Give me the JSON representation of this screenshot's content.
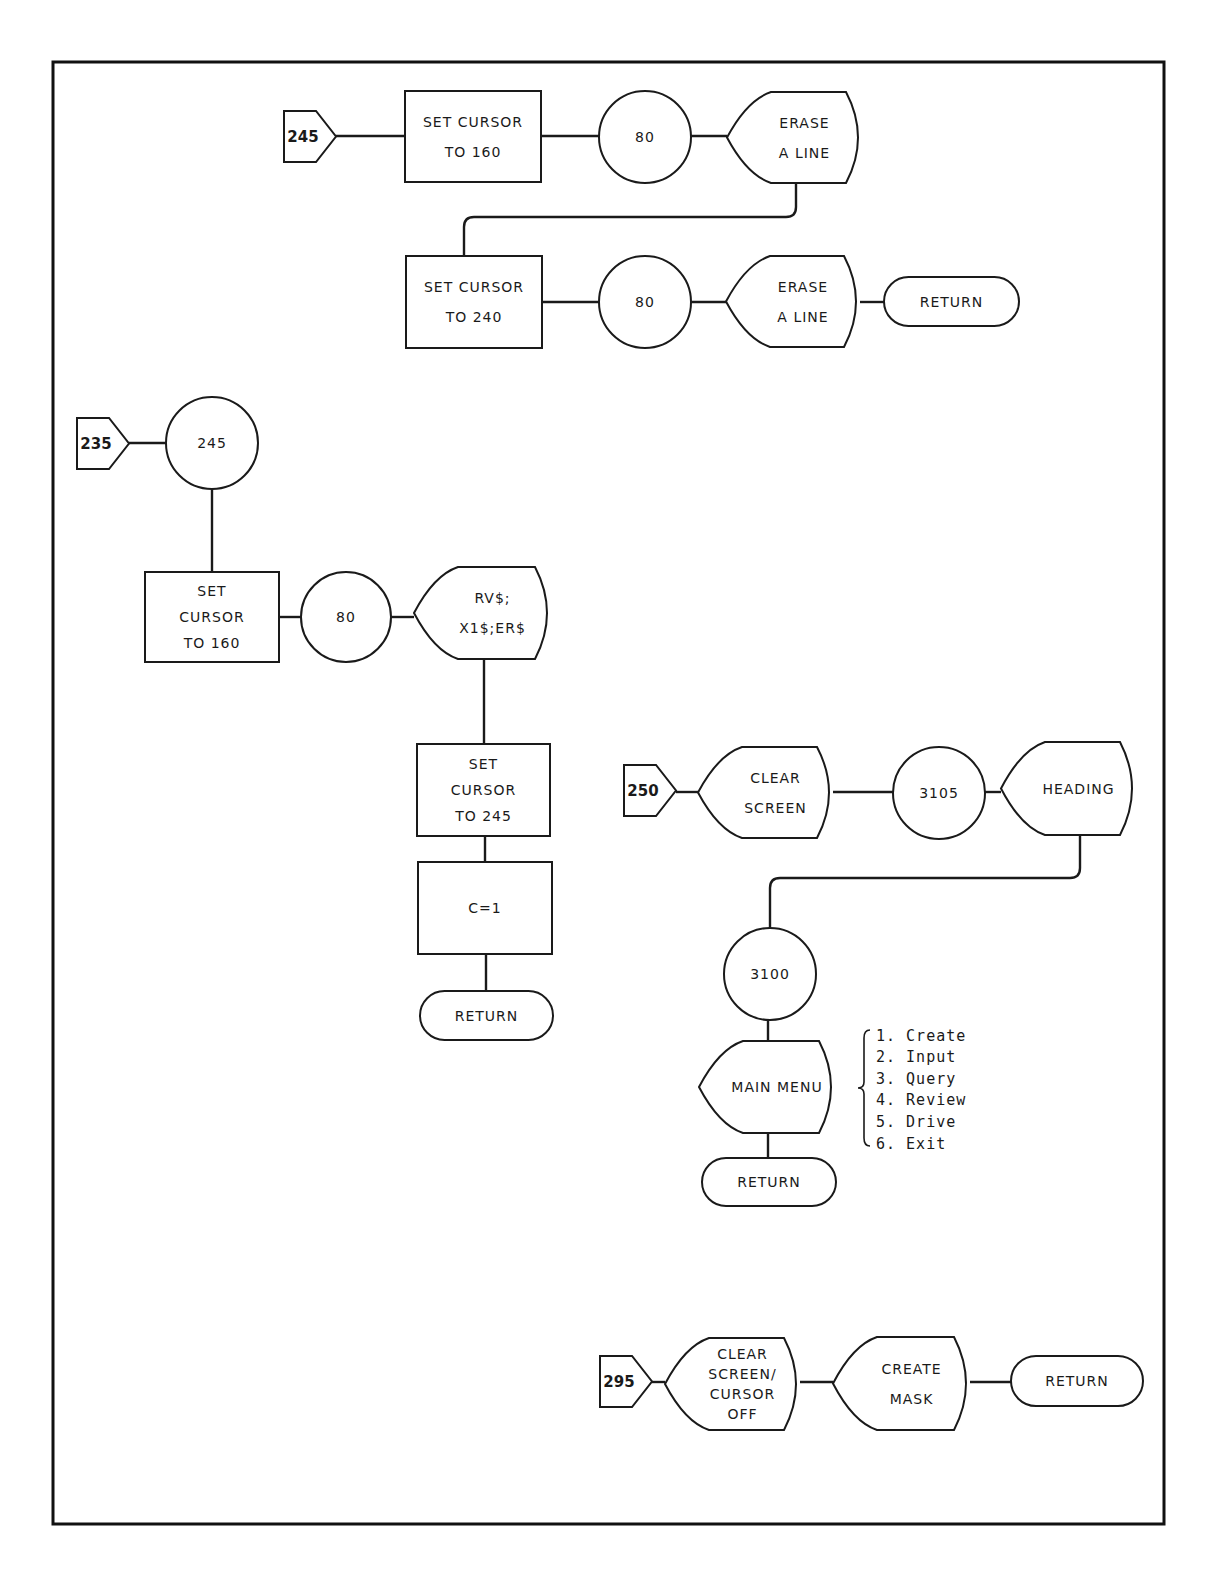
{
  "page": {
    "background": "#ffffff",
    "ink": "#1a1a1a",
    "frame": {
      "x": 53,
      "y": 62,
      "w": 1111,
      "h": 1462
    }
  },
  "flows": [
    {
      "id": "flow-245",
      "entry": {
        "label": "245",
        "x": 284,
        "y": 111,
        "w": 52,
        "h": 51
      },
      "nodes": [
        {
          "id": "f245-set-cursor-160",
          "type": "process",
          "lines": [
            "SET CURSOR",
            "TO 160"
          ],
          "x": 405,
          "y": 91,
          "w": 136,
          "h": 91
        },
        {
          "id": "f245-call-80-a",
          "type": "connector",
          "lines": [
            "80"
          ],
          "cx": 645,
          "cy": 137,
          "r": 46
        },
        {
          "id": "f245-erase-line-a",
          "type": "display",
          "lines": [
            "ERASE",
            "A LINE"
          ],
          "x": 727,
          "y": 92,
          "w": 135,
          "h": 91
        },
        {
          "id": "f245-set-cursor-240",
          "type": "process",
          "lines": [
            "SET CURSOR",
            "TO 240"
          ],
          "x": 406,
          "y": 256,
          "w": 136,
          "h": 92
        },
        {
          "id": "f245-call-80-b",
          "type": "connector",
          "lines": [
            "80"
          ],
          "cx": 645,
          "cy": 302,
          "r": 46
        },
        {
          "id": "f245-erase-line-b",
          "type": "display",
          "lines": [
            "ERASE",
            "A LINE"
          ],
          "x": 726,
          "y": 256,
          "w": 134,
          "h": 91
        },
        {
          "id": "f245-return",
          "type": "terminator",
          "lines": [
            "RETURN"
          ],
          "x": 884,
          "y": 277,
          "w": 135,
          "h": 49
        }
      ],
      "wires": [
        "M336 136 L405 136",
        "M541 136 L599 136",
        "M691 136 L727 136",
        "M796 183 L796 207 Q796 217 786 217 L474 217 Q464 217 464 227 L464 256",
        "M542 302 L599 302",
        "M691 302 L726 302",
        "M860 302 L884 302"
      ]
    },
    {
      "id": "flow-235",
      "entry": {
        "label": "235",
        "x": 77,
        "y": 418,
        "w": 52,
        "h": 51
      },
      "nodes": [
        {
          "id": "f235-call-245",
          "type": "connector",
          "lines": [
            "245"
          ],
          "cx": 212,
          "cy": 443,
          "r": 46
        },
        {
          "id": "f235-set-cursor-160",
          "type": "process",
          "lines": [
            "SET",
            "CURSOR",
            "TO 160"
          ],
          "x": 145,
          "y": 572,
          "w": 134,
          "h": 90
        },
        {
          "id": "f235-call-80",
          "type": "connector",
          "lines": [
            "80"
          ],
          "cx": 346,
          "cy": 617,
          "r": 45
        },
        {
          "id": "f235-print-rv",
          "type": "display",
          "lines": [
            "RV$;",
            "X1$;ER$"
          ],
          "x": 414,
          "y": 567,
          "w": 137,
          "h": 92
        },
        {
          "id": "f235-set-cursor-245",
          "type": "process",
          "lines": [
            "SET",
            "CURSOR",
            "TO 245"
          ],
          "x": 417,
          "y": 744,
          "w": 133,
          "h": 92
        },
        {
          "id": "f235-c-equals-1",
          "type": "process",
          "lines": [
            "C=1"
          ],
          "x": 418,
          "y": 862,
          "w": 134,
          "h": 92
        },
        {
          "id": "f235-return",
          "type": "terminator",
          "lines": [
            "RETURN"
          ],
          "x": 420,
          "y": 991,
          "w": 133,
          "h": 49
        }
      ],
      "wires": [
        "M129 443 L166 443",
        "M212 489 L212 572",
        "M279 617 L301 617",
        "M391 617 L414 617",
        "M484 659 L484 744",
        "M485 836 L485 862",
        "M486 954 L486 991"
      ]
    },
    {
      "id": "flow-250",
      "entry": {
        "label": "250",
        "x": 624,
        "y": 765,
        "w": 52,
        "h": 51
      },
      "nodes": [
        {
          "id": "f250-clear-screen",
          "type": "display",
          "lines": [
            "CLEAR",
            "SCREEN"
          ],
          "x": 698,
          "y": 747,
          "w": 135,
          "h": 91
        },
        {
          "id": "f250-call-3105",
          "type": "connector",
          "lines": [
            "3105"
          ],
          "cx": 939,
          "cy": 793,
          "r": 46
        },
        {
          "id": "f250-heading",
          "type": "display",
          "lines": [
            "HEADING"
          ],
          "x": 1001,
          "y": 742,
          "w": 135,
          "h": 93
        },
        {
          "id": "f250-call-3100",
          "type": "connector",
          "lines": [
            "3100"
          ],
          "cx": 770,
          "cy": 974,
          "r": 46
        },
        {
          "id": "f250-main-menu",
          "type": "display",
          "lines": [
            "MAIN MENU"
          ],
          "x": 699,
          "y": 1041,
          "w": 136,
          "h": 92
        },
        {
          "id": "f250-return",
          "type": "terminator",
          "lines": [
            "RETURN"
          ],
          "x": 702,
          "y": 1158,
          "w": 134,
          "h": 48
        }
      ],
      "wires": [
        "M676 792 L698 792",
        "M833 792 L893 792",
        "M985 792 L1001 792",
        "M1080 835 L1080 868 Q1080 878 1070 878 L780 878 Q770 878 770 888 L770 928",
        "M768 1020 L768 1041",
        "M768 1133 L768 1158"
      ],
      "menu_options": {
        "brace_x": 864,
        "top": 1030,
        "bottom": 1146,
        "text_x": 876,
        "items": [
          "1. Create",
          "2. Input",
          "3. Query",
          "4. Review",
          "5. Drive",
          "6. Exit"
        ]
      }
    },
    {
      "id": "flow-295",
      "entry": {
        "label": "295",
        "x": 600,
        "y": 1356,
        "w": 52,
        "h": 51
      },
      "nodes": [
        {
          "id": "f295-clear-screen-cursor-off",
          "type": "display",
          "lines": [
            "CLEAR",
            "SCREEN/",
            "CURSOR",
            "OFF"
          ],
          "x": 665,
          "y": 1338,
          "w": 135,
          "h": 92
        },
        {
          "id": "f295-create-mask",
          "type": "display",
          "lines": [
            "CREATE",
            "MASK"
          ],
          "x": 833,
          "y": 1337,
          "w": 137,
          "h": 93
        },
        {
          "id": "f295-return",
          "type": "terminator",
          "lines": [
            "RETURN"
          ],
          "x": 1011,
          "y": 1356,
          "w": 132,
          "h": 50
        }
      ],
      "wires": [
        "M652 1382 L665 1382",
        "M800 1382 L833 1382",
        "M970 1382 L1011 1382"
      ]
    }
  ]
}
